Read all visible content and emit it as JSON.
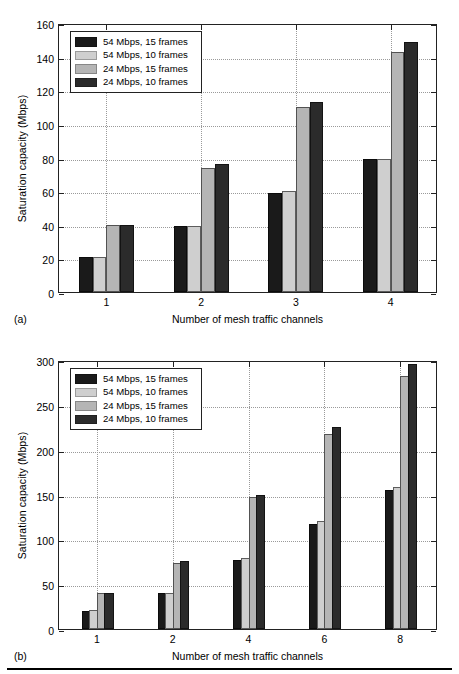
{
  "figure": {
    "colors": {
      "series_1": "#1a1a1a",
      "series_2": "#cfcfcf",
      "series_3": "#b5b5b5",
      "series_4": "#2b2b2b",
      "axis": "#222222",
      "grid": "#9a9a9a",
      "background": "#ffffff"
    },
    "legend_labels": [
      "54 Mbps, 15 frames",
      "54 Mbps, 10 frames",
      "24 Mbps, 15 frames",
      "24 Mbps, 10 frames"
    ]
  },
  "panel_a": {
    "caption": "(a)",
    "chart_data": {
      "type": "bar",
      "title": "",
      "xlabel": "Number of mesh traffic channels",
      "ylabel": "Saturation capacity (Mbps)",
      "categories": [
        "1",
        "2",
        "3",
        "4"
      ],
      "ylim": [
        0,
        160
      ],
      "yticks": [
        0,
        20,
        40,
        60,
        80,
        100,
        120,
        140,
        160
      ],
      "grid": true,
      "legend_position": "upper left",
      "series": [
        {
          "name": "54 Mbps, 15 frames",
          "color": "#1a1a1a",
          "values": [
            21,
            39,
            59,
            79
          ]
        },
        {
          "name": "54 Mbps, 10 frames",
          "color": "#cfcfcf",
          "values": [
            21,
            39.5,
            60,
            79
          ]
        },
        {
          "name": "24 Mbps, 15 frames",
          "color": "#b5b5b5",
          "values": [
            40,
            74,
            110,
            143
          ]
        },
        {
          "name": "24 Mbps, 10 frames",
          "color": "#2b2b2b",
          "values": [
            40,
            76,
            113,
            149
          ]
        }
      ]
    }
  },
  "panel_b": {
    "caption": "(b)",
    "chart_data": {
      "type": "bar",
      "title": "",
      "xlabel": "Number of mesh traffic channels",
      "ylabel": "Saturation capacity (Mbps)",
      "categories": [
        "1",
        "2",
        "4",
        "6",
        "8"
      ],
      "ylim": [
        0,
        300
      ],
      "yticks": [
        0,
        50,
        100,
        150,
        200,
        250,
        300
      ],
      "grid": true,
      "legend_position": "upper left",
      "series": [
        {
          "name": "54 Mbps, 15 frames",
          "color": "#1a1a1a",
          "values": [
            20,
            40,
            77,
            117,
            155
          ]
        },
        {
          "name": "54 Mbps, 10 frames",
          "color": "#cfcfcf",
          "values": [
            21,
            40,
            79,
            120,
            158
          ]
        },
        {
          "name": "24 Mbps, 15 frames",
          "color": "#b5b5b5",
          "values": [
            40,
            74,
            147,
            218,
            282
          ]
        },
        {
          "name": "24 Mbps, 10 frames",
          "color": "#2b2b2b",
          "values": [
            40,
            76,
            150,
            225,
            296
          ]
        }
      ]
    }
  }
}
